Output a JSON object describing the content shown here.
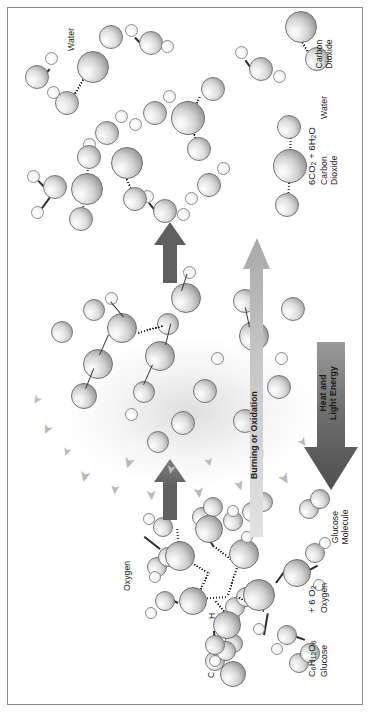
{
  "figure": {
    "border_color": "#8d8d8d",
    "background": "#ffffff"
  },
  "legend": {
    "items": [
      {
        "symbol": "C",
        "name": "carbon",
        "size": "large"
      },
      {
        "symbol": "O",
        "name": "oxygen",
        "size": "medium"
      },
      {
        "symbol": "H",
        "name": "hydrogen",
        "size": "small"
      }
    ]
  },
  "reactants": {
    "molecule_label": "Glucose\nMolecule",
    "oxygen_label": "Oxygen",
    "formula_glucose_line1": "C",
    "formula_glucose": "C6H12O6",
    "formula_glucose_name": "Glucose",
    "formula_oxygen": "+ 6 O2",
    "formula_oxygen_name": "Oxygen"
  },
  "process": {
    "arrow_label": "Burning or Oxidation",
    "energy_label": "Heat and\nLight Energy"
  },
  "products": {
    "carbon_dioxide_label": "Carbon\nDioxide",
    "water_label": "Water",
    "formula": "6CO2 + 6H2O",
    "formula_name_left": "Carbon\nDioxide",
    "formula_name_right": "Water"
  },
  "colors": {
    "carbon": "#9c9c9c",
    "oxygen": "#bcbcbc",
    "hydrogen": "#f2f2f2",
    "arrow_dark": "#5f5f5f",
    "arrow_light": "#c9c9c9",
    "text": "#1a1a1a"
  }
}
